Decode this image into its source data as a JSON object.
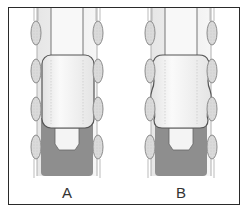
{
  "panels": [
    {
      "id": "A",
      "label": "A",
      "block_shape": "rounded-rectangle"
    },
    {
      "id": "B",
      "label": "B",
      "block_shape": "wavy-sided"
    }
  ],
  "colors": {
    "frame": "#2a2a2a",
    "tube_fill": "#efefef",
    "tube_line": "#8a8a8a",
    "ellipse_fill": "#dcdcdc",
    "ellipse_line": "#8c8c8c",
    "block_fill": "#f2f2f2",
    "block_line": "#555555",
    "base_fill": "#8e8e8e",
    "plug_fill": "#f4f4f4"
  }
}
